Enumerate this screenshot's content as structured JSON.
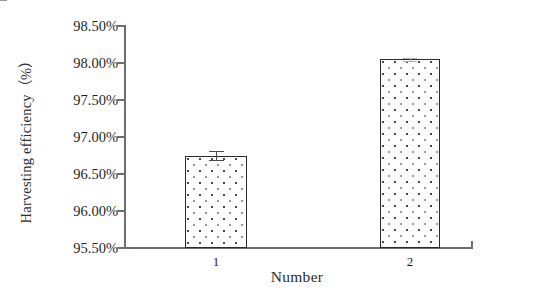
{
  "chart_data": {
    "type": "bar",
    "title": "",
    "xlabel": "Number",
    "ylabel": "Harvesting efficiency（%）",
    "categories": [
      "1",
      "2"
    ],
    "values": [
      96.75,
      98.05
    ],
    "errors": [
      0.06,
      0.02
    ],
    "value_labels": [
      "96.75%",
      "98.05%"
    ],
    "ylim": [
      95.5,
      98.5
    ],
    "ytick_values": [
      98.5,
      98.0,
      97.5,
      97.0,
      96.5,
      96.0,
      95.5
    ],
    "ytick_labels": [
      "98.50%",
      "98.00%",
      "97.50%",
      "97.00%",
      "96.50%",
      "96.00%",
      "95.50%"
    ],
    "grid": false,
    "legend": null,
    "legend_position": "none",
    "series": [
      {
        "name": "Harvesting efficiency",
        "values": [
          96.75,
          98.05
        ],
        "errors": [
          0.06,
          0.02
        ]
      }
    ],
    "colors": {
      "bar_fill": "#fdfdfd",
      "bar_pattern_dot": "#4a4a4a",
      "bar_outline": "#2a2a2a",
      "axis": "#6e6e6e",
      "text": "#1f1f1f",
      "background": "#ffffff"
    }
  },
  "axes": {
    "y_title": "Harvesting efficiency（%）",
    "x_title": "Number",
    "y_ticks": [
      {
        "label": "98.50%",
        "value": 98.5
      },
      {
        "label": "98.00%",
        "value": 98.0
      },
      {
        "label": "97.50%",
        "value": 97.5
      },
      {
        "label": "97.00%",
        "value": 97.0
      },
      {
        "label": "96.50%",
        "value": 96.5
      },
      {
        "label": "96.00%",
        "value": 96.0
      },
      {
        "label": "95.50%",
        "value": 95.5
      }
    ],
    "x_ticks": [
      {
        "label": "1"
      },
      {
        "label": "2"
      }
    ]
  }
}
